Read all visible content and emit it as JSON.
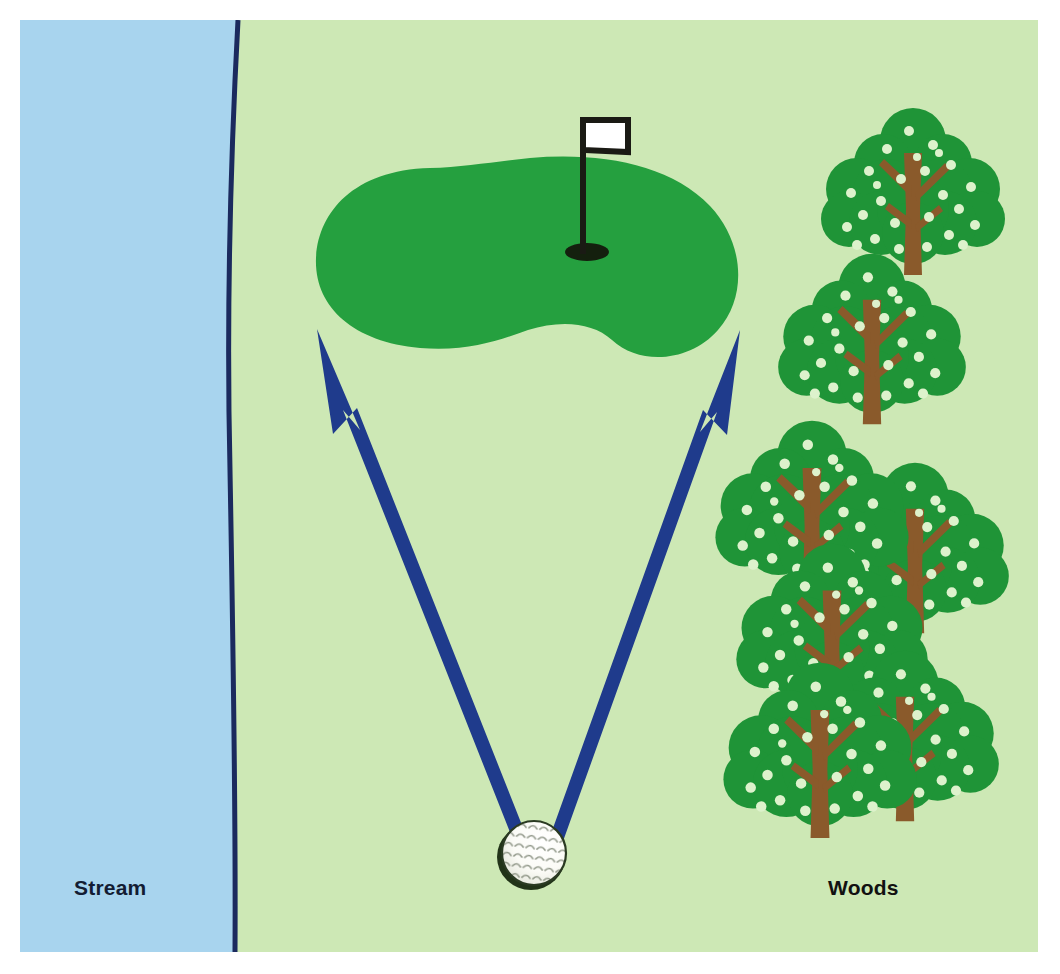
{
  "diagram": {
    "canvas": {
      "width": 1060,
      "height": 974
    },
    "frame": {
      "left": 20,
      "top": 20,
      "right": 1038,
      "bottom": 952
    }
  },
  "labels": {
    "stream": "Stream",
    "woods": "Woods"
  },
  "colors": {
    "water": "#a8d4ee",
    "fairway": "#cde8b5",
    "green": "#25a03f",
    "stream_outline": "#1b2a5e",
    "arrow": "#1f3b8c",
    "tree_canopy": "#1f9437",
    "tree_dot": "#ddf2cc",
    "tree_trunk": "#8a5a2b",
    "flag_cloth": "#ffffff",
    "flag_pole": "#1a1a14",
    "hole": "#14200e",
    "ball": "#ffffff",
    "ball_shadow": "#213318",
    "label_stream_text": "#131c33",
    "label_woods_text": "#111111"
  },
  "features": {
    "stream": {
      "name": "Stream",
      "side": "left",
      "fill": "#a8d4ee",
      "outline_width": 5
    },
    "fairway": {
      "name": "Fairway",
      "fill": "#cde8b5"
    },
    "putting_green": {
      "name": "Putting green",
      "shape": "kidney",
      "center": [
        528,
        255
      ]
    },
    "hole": {
      "name": "Hole cup",
      "center": [
        587,
        252
      ],
      "rx": 22,
      "ry": 9
    },
    "flag": {
      "name": "Flagstick with white flag",
      "pole_x": 583,
      "pole_top": 118,
      "pole_bottom": 252,
      "cloth": {
        "x": 583,
        "y": 118,
        "width": 46,
        "height": 35
      }
    },
    "golf_ball": {
      "name": "Golf ball",
      "center": [
        531,
        855
      ],
      "radius": 33
    },
    "trees": {
      "name": "Woods tree cluster",
      "count": 7,
      "positions": [
        [
          913,
          215
        ],
        [
          872,
          360
        ],
        [
          812,
          530
        ],
        [
          915,
          570
        ],
        [
          832,
          650
        ],
        [
          905,
          755
        ],
        [
          822,
          768
        ]
      ]
    }
  },
  "arrows": [
    {
      "name": "left-shot-path",
      "from": [
        525,
        852
      ],
      "to": [
        317,
        329
      ],
      "description": "Shot line to left side of green",
      "color": "#1f3b8c"
    },
    {
      "name": "right-shot-path",
      "from": [
        545,
        852
      ],
      "to": [
        740,
        330
      ],
      "description": "Shot line to right side of green",
      "color": "#1f3b8c"
    }
  ]
}
